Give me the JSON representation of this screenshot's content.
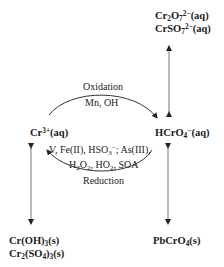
{
  "diagram": {
    "nodes": {
      "dichromate": {
        "line1_base": "Cr",
        "line1_sub1": "2",
        "line1_mid": "O",
        "line1_sub2": "7",
        "line1_sup": "2−",
        "line1_tail": "(aq)"
      },
      "chromosulfate": {
        "base": "CrSO",
        "sub": "7",
        "sup": "2−",
        "tail": "(aq)"
      },
      "cr3": {
        "base": "Cr",
        "sup": "3+",
        "tail": "(aq)"
      },
      "hcro4": {
        "base": "HCrO",
        "sub": "4",
        "sup": "−",
        "tail": "(aq)"
      },
      "croh3": {
        "base": "Cr(OH)",
        "sub": "3",
        "tail": "(s)"
      },
      "cr2so43": {
        "a": "Cr",
        "a_sub": "2",
        "b": "(SO",
        "b_sub": "4",
        "c": ")",
        "c_sub": "3",
        "tail": "(s)"
      },
      "pbcro4": {
        "base": "PbCrO",
        "sub": "4",
        "tail": "(s)"
      }
    },
    "oxidation": {
      "label": "Oxidation",
      "agents": "Mn, OH"
    },
    "reduction": {
      "label": "Reduction",
      "agents_line1_a": "V, Fe(II), HSO",
      "agents_line1_sub": "3",
      "agents_line1_sup": "−",
      "agents_line1_b": "; As(III),",
      "agents_line2_a": "H",
      "agents_line2_sub1": "2",
      "agents_line2_b": "O",
      "agents_line2_sub2": "2",
      "agents_line2_c": ", HO",
      "agents_line2_sub3": "2",
      "agents_line2_d": ", SOA"
    },
    "edges": [
      {
        "from": "cr3",
        "to": "hcro4",
        "type": "oxidation-arc",
        "direction": "forward"
      },
      {
        "from": "hcro4",
        "to": "cr3",
        "type": "reduction-arc",
        "direction": "forward"
      },
      {
        "from": "hcro4",
        "to": "dichromate",
        "type": "equilibrium",
        "direction": "both"
      },
      {
        "from": "cr3",
        "to": "croh3",
        "type": "equilibrium",
        "direction": "both"
      },
      {
        "from": "hcro4",
        "to": "pbcro4",
        "type": "equilibrium",
        "direction": "both"
      }
    ],
    "colors": {
      "text": "#1a1a1a",
      "line": "#555555",
      "background": "#ffffff"
    }
  }
}
